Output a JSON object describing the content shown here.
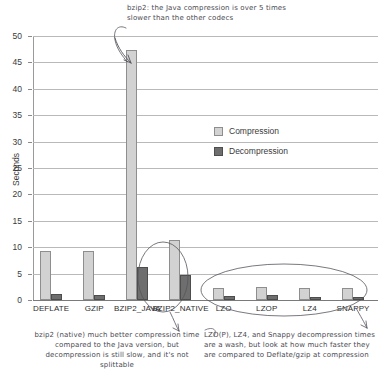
{
  "chart_data": {
    "type": "bar",
    "title": "",
    "xlabel": "",
    "ylabel": "Seconds",
    "ylim": [
      0,
      50
    ],
    "yticks": [
      0,
      5,
      10,
      15,
      20,
      25,
      30,
      35,
      40,
      45,
      50
    ],
    "grid": true,
    "legend_position": "center",
    "categories": [
      "DEFLATE",
      "GZIP",
      "BZIP2_JAVA",
      "BZIP2_NATIVE",
      "LZO",
      "LZOP",
      "LZ4",
      "SNAPPY"
    ],
    "series": [
      {
        "name": "Compression",
        "color": "#d2d2d2",
        "values": [
          9.2,
          9.2,
          47.3,
          11.3,
          2.3,
          2.5,
          2.2,
          2.2
        ]
      },
      {
        "name": "Decompression",
        "color": "#6e6e6e",
        "values": [
          1.1,
          0.9,
          6.3,
          4.7,
          0.7,
          0.9,
          0.6,
          0.6
        ]
      }
    ],
    "annotations": [
      {
        "id": "top",
        "text": "bzip2: the Java compression is over 5 times slower than the other codecs",
        "target": "BZIP2_JAVA"
      },
      {
        "id": "bottom-left",
        "text": "bzip2 (native) much better compression time compared to the Java version, but decompression is still slow, and it's not splittable",
        "target": "BZIP2_NATIVE"
      },
      {
        "id": "bottom-right",
        "text": "LZO(P), LZ4, and Snappy decompression times are a wash, but look at how much faster they are compared to Deflate/gzip at compression",
        "target": "LZO,LZOP,LZ4,SNAPPY"
      }
    ]
  },
  "axis": {
    "ylabel": "Seconds",
    "ytick_labels": [
      "0",
      "5",
      "10",
      "15",
      "20",
      "25",
      "30",
      "35",
      "40",
      "45",
      "50"
    ]
  },
  "legend": {
    "compression_label": "Compression",
    "decompression_label": "Decompression"
  },
  "xlabels": {
    "0": "DEFLATE",
    "1": "GZIP",
    "2": "BZIP2_JAVA",
    "3": "BZIP2_NATIVE",
    "4": "LZO",
    "5": "LZOP",
    "6": "LZ4",
    "7": "SNAPPY"
  },
  "annotations": {
    "top": "bzip2: the Java compression is over 5 times slower than the other codecs",
    "bottom_left": "bzip2 (native) much better compression time compared to the Java version, but decompression is still slow, and it's not splittable",
    "bottom_right": "LZO(P), LZ4, and Snappy decompression times are a wash, but look at how much faster they are compared to Deflate/gzip at compression"
  }
}
